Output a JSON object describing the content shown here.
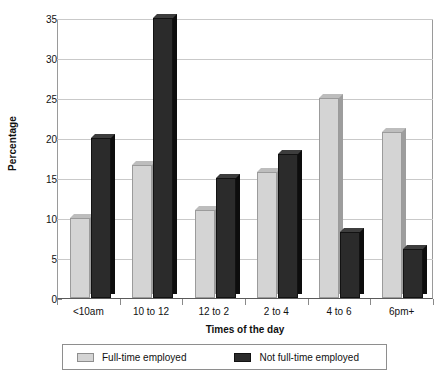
{
  "chart_data": {
    "type": "bar",
    "title": "",
    "xlabel": "Times of the day",
    "ylabel": "Percentage",
    "categories": [
      "<10am",
      "10 to 12",
      "12 to 2",
      "2 to 4",
      "4 to 6",
      "6pm+"
    ],
    "series": [
      {
        "name": "Full-time employed",
        "color": "#d4d4d4",
        "values": [
          10,
          16.6,
          11,
          15.7,
          25,
          20.8
        ]
      },
      {
        "name": "Not full-time employed",
        "color": "#2b2b2b",
        "values": [
          20,
          35,
          15,
          18,
          8.2,
          6.1
        ]
      }
    ],
    "ylim": [
      0,
      35
    ],
    "yticks": [
      0,
      5,
      10,
      15,
      20,
      25,
      30,
      35
    ],
    "ytick_labels": [
      "0",
      "5",
      "10",
      "15",
      "20",
      "25",
      "30",
      "35"
    ],
    "grid": true,
    "legend_position": "bottom"
  },
  "legend": {
    "items": [
      {
        "label": "Full-time employed"
      },
      {
        "label": "Not full-time employed"
      }
    ]
  }
}
